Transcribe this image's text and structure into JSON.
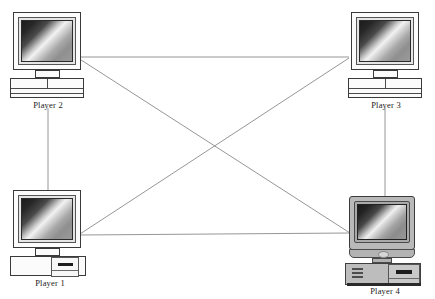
{
  "diagram": {
    "background_color": "#ffffff",
    "line_color": "#808080",
    "nodes": [
      {
        "id": "player2",
        "label": "Player 2",
        "style": "classic-crt",
        "position": {
          "x": 13,
          "y": 13
        },
        "connector": {
          "x": 78,
          "y": 57
        }
      },
      {
        "id": "player3",
        "label": "Player 3",
        "style": "classic-crt",
        "position": {
          "x": 349,
          "y": 13
        },
        "connector": {
          "x": 349,
          "y": 57
        }
      },
      {
        "id": "player1",
        "label": "Player 1",
        "style": "classic-crt-tower",
        "position": {
          "x": 13,
          "y": 190
        },
        "connector": {
          "x": 80,
          "y": 235
        }
      },
      {
        "id": "player4",
        "label": "Player 4",
        "style": "modern-gray",
        "position": {
          "x": 347,
          "y": 196
        },
        "connector": {
          "x": 350,
          "y": 233
        }
      }
    ],
    "links": [
      {
        "from": "player2",
        "to": "player3",
        "type": "horizontal-top"
      },
      {
        "from": "player1",
        "to": "player4",
        "type": "horizontal-bottom"
      },
      {
        "from": "player2",
        "to": "player1",
        "type": "vertical-left"
      },
      {
        "from": "player3",
        "to": "player4",
        "type": "vertical-right"
      },
      {
        "from": "player2",
        "to": "player4",
        "type": "diagonal"
      },
      {
        "from": "player3",
        "to": "player1",
        "type": "diagonal"
      }
    ]
  },
  "labels": {
    "player1": "Player 1",
    "player2": "Player 2",
    "player3": "Player 3",
    "player4": "Player 4"
  }
}
